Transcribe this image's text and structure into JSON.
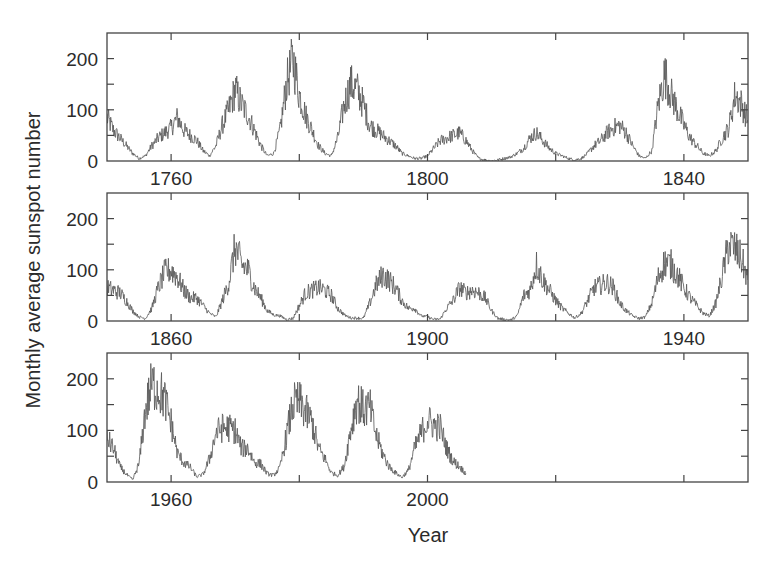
{
  "chart_data": {
    "type": "line",
    "title": "",
    "xlabel": "Year",
    "ylabel": "Monthly average sunspot number",
    "grid": false,
    "legend": null,
    "line_color": "#555555",
    "panels": [
      {
        "xlim": [
          1750,
          1850
        ],
        "ylim": [
          0,
          250
        ],
        "x_ticks": [
          1760,
          1780,
          1800,
          1820,
          1840
        ],
        "x_tick_labels": [
          "1760",
          "",
          "1800",
          "",
          "1840"
        ],
        "y_ticks": [
          0,
          50,
          100,
          150,
          200,
          250
        ],
        "y_tick_labels": [
          "0",
          "",
          "100",
          "",
          "200",
          ""
        ],
        "series": {
          "name": "Monthly average sunspot number",
          "x": [
            1750,
            1751,
            1752,
            1753,
            1754,
            1755,
            1756,
            1757,
            1758,
            1759,
            1760,
            1761,
            1762,
            1763,
            1764,
            1765,
            1766,
            1767,
            1768,
            1769,
            1770,
            1771,
            1772,
            1773,
            1774,
            1775,
            1776,
            1777,
            1778,
            1779,
            1780,
            1781,
            1782,
            1783,
            1784,
            1785,
            1786,
            1787,
            1788,
            1789,
            1790,
            1791,
            1792,
            1793,
            1794,
            1795,
            1796,
            1797,
            1798,
            1799,
            1800,
            1801,
            1802,
            1803,
            1804,
            1805,
            1806,
            1807,
            1808,
            1809,
            1810,
            1811,
            1812,
            1813,
            1814,
            1815,
            1816,
            1817,
            1818,
            1819,
            1820,
            1821,
            1822,
            1823,
            1824,
            1825,
            1826,
            1827,
            1828,
            1829,
            1830,
            1831,
            1832,
            1833,
            1834,
            1835,
            1836,
            1837,
            1838,
            1839,
            1840,
            1841,
            1842,
            1843,
            1844,
            1845,
            1846,
            1847,
            1848,
            1849,
            1850
          ],
          "y": [
            85,
            60,
            45,
            30,
            15,
            5,
            10,
            30,
            45,
            55,
            65,
            85,
            60,
            50,
            40,
            20,
            10,
            30,
            70,
            100,
            140,
            110,
            90,
            60,
            30,
            10,
            15,
            60,
            150,
            200,
            130,
            90,
            60,
            30,
            15,
            10,
            45,
            110,
            150,
            140,
            110,
            70,
            60,
            50,
            40,
            30,
            15,
            10,
            5,
            5,
            10,
            25,
            40,
            45,
            50,
            55,
            40,
            20,
            5,
            2,
            0,
            2,
            5,
            8,
            15,
            25,
            45,
            55,
            40,
            25,
            15,
            10,
            5,
            2,
            5,
            15,
            30,
            40,
            55,
            65,
            70,
            55,
            30,
            10,
            5,
            20,
            110,
            170,
            130,
            100,
            70,
            45,
            30,
            15,
            10,
            20,
            45,
            65,
            130,
            110,
            80
          ]
        }
      },
      {
        "xlim": [
          1850,
          1950
        ],
        "ylim": [
          0,
          250
        ],
        "x_ticks": [
          1860,
          1880,
          1900,
          1920,
          1940
        ],
        "x_tick_labels": [
          "1860",
          "",
          "1900",
          "",
          "1940"
        ],
        "y_ticks": [
          0,
          50,
          100,
          150,
          200,
          250
        ],
        "y_tick_labels": [
          "0",
          "",
          "100",
          "",
          "200",
          ""
        ],
        "series": {
          "name": "Monthly average sunspot number",
          "x": [
            1850,
            1851,
            1852,
            1853,
            1854,
            1855,
            1856,
            1857,
            1858,
            1859,
            1860,
            1861,
            1862,
            1863,
            1864,
            1865,
            1866,
            1867,
            1868,
            1869,
            1870,
            1871,
            1872,
            1873,
            1874,
            1875,
            1876,
            1877,
            1878,
            1879,
            1880,
            1881,
            1882,
            1883,
            1884,
            1885,
            1886,
            1887,
            1888,
            1889,
            1890,
            1891,
            1892,
            1893,
            1894,
            1895,
            1896,
            1897,
            1898,
            1899,
            1900,
            1901,
            1902,
            1903,
            1904,
            1905,
            1906,
            1907,
            1908,
            1909,
            1910,
            1911,
            1912,
            1913,
            1914,
            1915,
            1916,
            1917,
            1918,
            1919,
            1920,
            1921,
            1922,
            1923,
            1924,
            1925,
            1926,
            1927,
            1928,
            1929,
            1930,
            1931,
            1932,
            1933,
            1934,
            1935,
            1936,
            1937,
            1938,
            1939,
            1940,
            1941,
            1942,
            1943,
            1944,
            1945,
            1946,
            1947,
            1948,
            1949,
            1950
          ],
          "y": [
            65,
            60,
            55,
            40,
            20,
            8,
            5,
            25,
            65,
            95,
            100,
            85,
            60,
            45,
            45,
            30,
            15,
            8,
            40,
            75,
            145,
            110,
            100,
            65,
            45,
            20,
            12,
            10,
            3,
            5,
            30,
            55,
            60,
            65,
            60,
            50,
            25,
            12,
            6,
            6,
            5,
            35,
            70,
            90,
            80,
            65,
            40,
            25,
            25,
            10,
            8,
            3,
            4,
            25,
            40,
            65,
            55,
            60,
            55,
            45,
            20,
            5,
            3,
            2,
            10,
            50,
            60,
            110,
            80,
            60,
            40,
            25,
            15,
            6,
            15,
            40,
            65,
            70,
            75,
            65,
            35,
            20,
            10,
            5,
            8,
            35,
            85,
            115,
            110,
            90,
            65,
            45,
            30,
            15,
            10,
            35,
            90,
            150,
            140,
            120,
            80
          ]
        }
      },
      {
        "xlim": [
          1950,
          2050
        ],
        "ylim": [
          0,
          250
        ],
        "x_ticks": [
          1960,
          1980,
          2000,
          2020,
          2040
        ],
        "x_tick_labels": [
          "1960",
          "",
          "2000",
          "",
          ""
        ],
        "y_ticks": [
          0,
          50,
          100,
          150,
          200,
          250
        ],
        "y_tick_labels": [
          "0",
          "",
          "100",
          "",
          "200",
          ""
        ],
        "series": {
          "name": "Monthly average sunspot number",
          "x": [
            1950,
            1951,
            1952,
            1953,
            1954,
            1955,
            1956,
            1957,
            1958,
            1959,
            1960,
            1961,
            1962,
            1963,
            1964,
            1965,
            1966,
            1967,
            1968,
            1969,
            1970,
            1971,
            1972,
            1973,
            1974,
            1975,
            1976,
            1977,
            1978,
            1979,
            1980,
            1981,
            1982,
            1983,
            1984,
            1985,
            1986,
            1987,
            1988,
            1989,
            1990,
            1991,
            1992,
            1993,
            1994,
            1995,
            1996,
            1997,
            1998,
            1999,
            2000,
            2001,
            2002,
            2003,
            2004,
            2005,
            2006
          ],
          "y": [
            85,
            65,
            30,
            15,
            4,
            35,
            140,
            190,
            180,
            160,
            115,
            55,
            38,
            28,
            10,
            15,
            45,
            95,
            105,
            105,
            100,
            65,
            65,
            38,
            35,
            16,
            13,
            28,
            90,
            150,
            155,
            135,
            115,
            65,
            45,
            18,
            13,
            30,
            100,
            160,
            140,
            145,
            90,
            55,
            30,
            18,
            9,
            22,
            65,
            95,
            120,
            110,
            105,
            65,
            40,
            30,
            16
          ]
        }
      }
    ]
  }
}
